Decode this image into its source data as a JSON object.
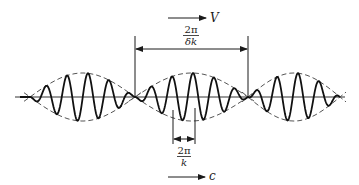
{
  "diagram": {
    "labels": {
      "group_velocity": "V",
      "phase_velocity": "c",
      "group_length_num": "2π",
      "group_length_den": "δk",
      "wavelength_num": "2π",
      "wavelength_den": "k"
    },
    "geometry": {
      "axis_y": 97,
      "axis_x_start": 15,
      "axis_x_end": 345,
      "envelope_nodes_x": [
        30,
        135,
        248,
        340
      ],
      "envelope_amplitude": 24,
      "carrier_period_px": 21,
      "group_marker_x": [
        135,
        248
      ],
      "wavelength_marker_x": [
        173,
        195
      ]
    },
    "colors": {
      "ink": "#1a1a1a",
      "envelope": "#555555",
      "axis": "#333333"
    }
  }
}
